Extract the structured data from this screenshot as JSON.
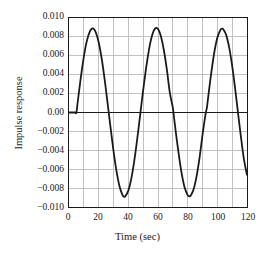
{
  "chart_data": {
    "type": "line",
    "title": "",
    "xlabel": "Time (sec)",
    "ylabel": "Impulse response",
    "xlim": [
      0,
      120
    ],
    "ylim": [
      -0.01,
      0.01
    ],
    "grid": true,
    "legend": null,
    "xticks": [
      0,
      20,
      40,
      60,
      80,
      100,
      120
    ],
    "xtick_labels": [
      "0",
      "20",
      "40",
      "60",
      "80",
      "100",
      "120"
    ],
    "yticks": [
      0.01,
      0.008,
      0.006,
      0.004,
      0.002,
      0.0,
      -0.002,
      -0.004,
      -0.006,
      -0.008,
      -0.01
    ],
    "ytick_labels": [
      "0.010",
      "0.008",
      "0.006",
      "0.004",
      "0.002",
      "0.00",
      "−0.002",
      "−0.004",
      "−0.006",
      "−0.008",
      "−0.010"
    ],
    "x_minor_gridlines": [
      10,
      30,
      50,
      70,
      90,
      110
    ],
    "series": [
      {
        "name": "impulse response",
        "color": "#1a1a1a",
        "linewidth": 1.8,
        "delay": 5,
        "amplitude": 0.0089,
        "period": 44,
        "description": "Sinusoidal impulse response, zero until t=5 s, then steady oscillation",
        "x": [
          0,
          2,
          4,
          5,
          6,
          8,
          10,
          12,
          14,
          16,
          18,
          20,
          22,
          24,
          26,
          27,
          28,
          30,
          32,
          34,
          36,
          37,
          38,
          40,
          42,
          44,
          46,
          48,
          49,
          50,
          52,
          54,
          56,
          58,
          60,
          62,
          64,
          66,
          68,
          70,
          71,
          72,
          74,
          76,
          78,
          80,
          81,
          82,
          84,
          86,
          88,
          90,
          92,
          93,
          94,
          96,
          98,
          100,
          102,
          103,
          104,
          106,
          108,
          110,
          112,
          114,
          116,
          118,
          120
        ],
        "y": [
          0,
          0,
          0,
          0,
          0.00127,
          0.00374,
          0.00589,
          0.00755,
          0.00857,
          0.0089,
          0.00851,
          0.00744,
          0.00574,
          0.00354,
          0.00101,
          -0.00029,
          -0.00158,
          -0.00406,
          -0.00618,
          -0.00778,
          -0.00872,
          -0.0089,
          -0.00885,
          -0.00827,
          -0.007,
          -0.00513,
          -0.0028,
          -0.00022,
          0.00107,
          0.00235,
          0.00472,
          0.00671,
          0.00814,
          0.00887,
          0.00884,
          0.00805,
          0.00656,
          0.0045,
          0.00207,
          0.00052,
          -0.00078,
          -0.00207,
          -0.00443,
          -0.0065,
          -0.00796,
          -0.00874,
          -0.00886,
          -0.0088,
          -0.00813,
          -0.00676,
          -0.0048,
          -0.00239,
          -0.00022,
          0.00055,
          0.00185,
          0.0043,
          0.0064,
          0.0079,
          0.00872,
          0.00886,
          0.00882,
          0.00819,
          0.00686,
          0.00493,
          0.00253,
          -0.00011,
          -0.0027,
          -0.00502,
          -0.0066
        ]
      }
    ]
  },
  "style": {
    "axis_color": "#1a1a1a",
    "grid_color": "#b9b9b9",
    "zero_line_color": "#1a1a1a",
    "background": "#ffffff"
  }
}
